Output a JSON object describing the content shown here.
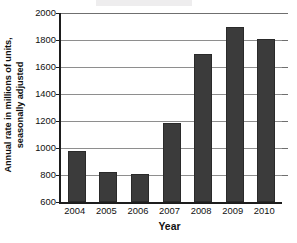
{
  "chart_data": {
    "type": "bar",
    "title": "",
    "xlabel": "Year",
    "ylabel": "Annual rate in millions of units, seasonally adjusted",
    "ylabel_lines": [
      "Annual rate in millions of units,",
      "seasonally adjusted"
    ],
    "categories": [
      "2004",
      "2005",
      "2006",
      "2007",
      "2008",
      "2009",
      "2010"
    ],
    "values": [
      980,
      825,
      805,
      1185,
      1700,
      1900,
      1805
    ],
    "ylim": [
      600,
      2000
    ],
    "yticks": [
      600,
      800,
      1000,
      1200,
      1400,
      1600,
      1800,
      2000
    ],
    "ytick_labels": [
      "600",
      "800",
      "1000",
      "1200",
      "1400",
      "1600",
      "1800",
      "2000"
    ],
    "grid": true,
    "legend": null,
    "bar_color": "#3b3b3b",
    "gridline_color": "#8e8e8e",
    "axis_color": "#1d1d1d",
    "background_color": "#ffffff",
    "series": [
      {
        "name": "Annual rate",
        "values": [
          980,
          825,
          805,
          1185,
          1700,
          1900,
          1805
        ]
      }
    ]
  }
}
